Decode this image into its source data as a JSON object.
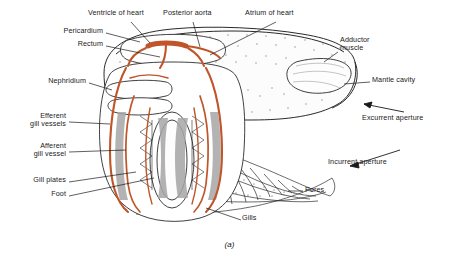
{
  "figure": {
    "caption": "(a)",
    "organism_view": "bivalve mollusc internal anatomy, left valve removed",
    "colors": {
      "outline": "#2b2b2b",
      "vessel_orange": "#c0552a",
      "gill_gray": "#9a9a9a",
      "shell_fill": "#fbfbfb",
      "stipple": "#7a7a7a",
      "text": "#1a1a1a"
    }
  },
  "labels": [
    {
      "id": "ventricle-of-heart",
      "text": "Ventricle of heart",
      "x": 88,
      "y": 13,
      "align": "left"
    },
    {
      "id": "posterior-aorta",
      "text": "Posterior aorta",
      "x": 163,
      "y": 13,
      "align": "left"
    },
    {
      "id": "atrium-of-heart",
      "text": "Atrium of heart",
      "x": 245,
      "y": 13,
      "align": "left"
    },
    {
      "id": "pericardium",
      "text": "Pericardium",
      "x": 103,
      "y": 31,
      "align": "right"
    },
    {
      "id": "rectum",
      "text": "Rectum",
      "x": 103,
      "y": 44,
      "align": "right"
    },
    {
      "id": "adductor-muscle",
      "text": "Adductor\nmuscle",
      "x": 340,
      "y": 42,
      "align": "left"
    },
    {
      "id": "nephridium",
      "text": "Nephridium",
      "x": 86,
      "y": 81,
      "align": "right"
    },
    {
      "id": "mantle-cavity",
      "text": "Mantle cavity",
      "x": 372,
      "y": 80,
      "align": "left"
    },
    {
      "id": "efferent-gill-vessels",
      "text": "Efferent\ngill vessels",
      "x": 66,
      "y": 118,
      "align": "right"
    },
    {
      "id": "excurrent-aperture",
      "text": "Excurrent aperture",
      "x": 362,
      "y": 118,
      "align": "left"
    },
    {
      "id": "afferent-gill-vessel",
      "text": "Afferent\ngill vessel",
      "x": 66,
      "y": 148,
      "align": "right"
    },
    {
      "id": "incurrent-aperture",
      "text": "Incurrent aperture",
      "x": 328,
      "y": 162,
      "align": "left"
    },
    {
      "id": "gill-plates",
      "text": "Gill plates",
      "x": 66,
      "y": 180,
      "align": "right"
    },
    {
      "id": "foot",
      "text": "Foot",
      "x": 66,
      "y": 194,
      "align": "right"
    },
    {
      "id": "pores",
      "text": "Pores",
      "x": 305,
      "y": 190,
      "align": "left"
    },
    {
      "id": "gills",
      "text": "Gills",
      "x": 242,
      "y": 218,
      "align": "left"
    }
  ]
}
